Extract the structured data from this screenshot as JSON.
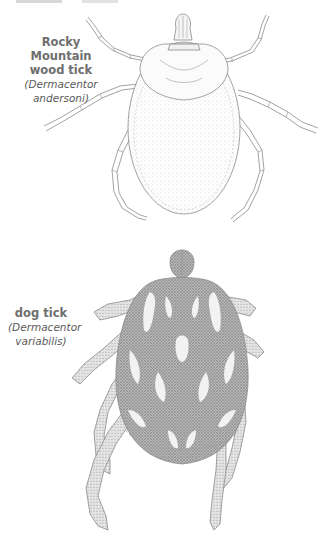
{
  "figure": {
    "specimens": [
      {
        "id": "rocky-mountain-wood-tick",
        "common_name_lines": [
          "Rocky",
          "Mountain",
          "wood tick"
        ],
        "scientific_name": "Dermacentor andersoni",
        "scientific_display": "(Dermacentor andersoni)"
      },
      {
        "id": "dog-tick",
        "common_name_lines": [
          "dog tick"
        ],
        "scientific_name": "Dermacentor variabilis",
        "scientific_display_lines": [
          "(Dermacentor",
          "variabilis)"
        ]
      }
    ],
    "colors": {
      "label_text": "#6e6e6e",
      "line_art": "#8a8a8a",
      "stipple_dark": "#7a7a7a",
      "background": "#ffffff"
    }
  }
}
